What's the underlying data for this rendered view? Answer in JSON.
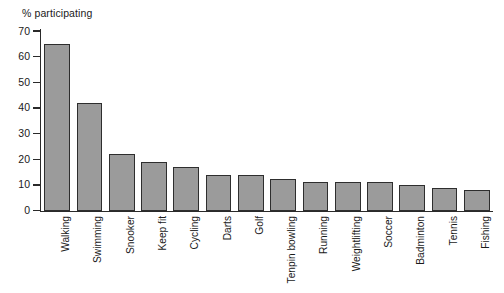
{
  "chart_data": {
    "type": "bar",
    "title": "",
    "ylabel": "% participating",
    "xlabel": "",
    "ylim": [
      0,
      70
    ],
    "yticks": [
      0,
      10,
      20,
      30,
      40,
      50,
      60,
      70
    ],
    "grid": false,
    "legend": "none",
    "orientation": "vertical",
    "bar_color": "#9b9b9b",
    "bar_edge_color": "#2e2e2e",
    "axis_color": "#2a2a2a",
    "categories": [
      "Walking",
      "Swimming",
      "Snooker",
      "Keep fit",
      "Cycling",
      "Darts",
      "Golf",
      "Tenpin bowling",
      "Running",
      "Weightlifting",
      "Soccer",
      "Badminton",
      "Tennis",
      "Fishing"
    ],
    "values": [
      65,
      42,
      22,
      19,
      17,
      14,
      14,
      12.5,
      11,
      11,
      11,
      10,
      9,
      8
    ]
  }
}
